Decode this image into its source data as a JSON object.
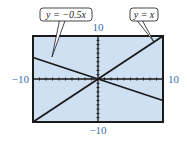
{
  "chart_data": {
    "type": "line",
    "title": "",
    "xlabel": "",
    "ylabel": "",
    "xlim": [
      -10,
      10
    ],
    "ylim": [
      -10,
      10
    ],
    "grid": false,
    "tick_marks": true,
    "tick_labels": {
      "x_min": "−10",
      "x_max": "10",
      "y_min": "−10",
      "y_max": "10"
    },
    "series": [
      {
        "name": "y = x",
        "equation": "y = x",
        "slope": 1,
        "x": [
          -10,
          10
        ],
        "y": [
          -10,
          10
        ]
      },
      {
        "name": "y = −0.5x",
        "equation": "y = −0.5x",
        "slope": -0.5,
        "x": [
          -10,
          10
        ],
        "y": [
          5,
          -5
        ]
      }
    ],
    "annotations": [
      {
        "text": "y = −0.5x",
        "points_to": "y = −0.5x"
      },
      {
        "text": "y = x",
        "points_to": "y = x"
      }
    ],
    "colors": {
      "screen_background": "#cfe0f3",
      "frame": "#1a1a1a",
      "lines": "#1a1a1a",
      "tick_labels": "#3a6fb0"
    }
  }
}
